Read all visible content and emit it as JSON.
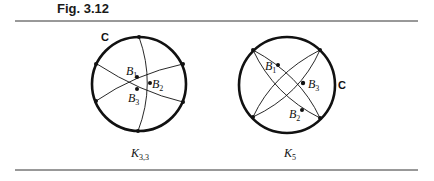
{
  "figure": {
    "title": "Fig. 3.12",
    "left": {
      "curve_label": "C",
      "caption_main": "K",
      "caption_sub": "3,3",
      "points": [
        {
          "label": "B",
          "sub": "1"
        },
        {
          "label": "B",
          "sub": "2"
        },
        {
          "label": "B",
          "sub": "3"
        }
      ]
    },
    "right": {
      "curve_label": "C",
      "caption_main": "K",
      "caption_sub": "5",
      "points": [
        {
          "label": "B",
          "sub": "1"
        },
        {
          "label": "B",
          "sub": "3"
        },
        {
          "label": "B",
          "sub": "2"
        }
      ]
    }
  },
  "colors": {
    "ink": "#111111",
    "rule": "#333333"
  }
}
